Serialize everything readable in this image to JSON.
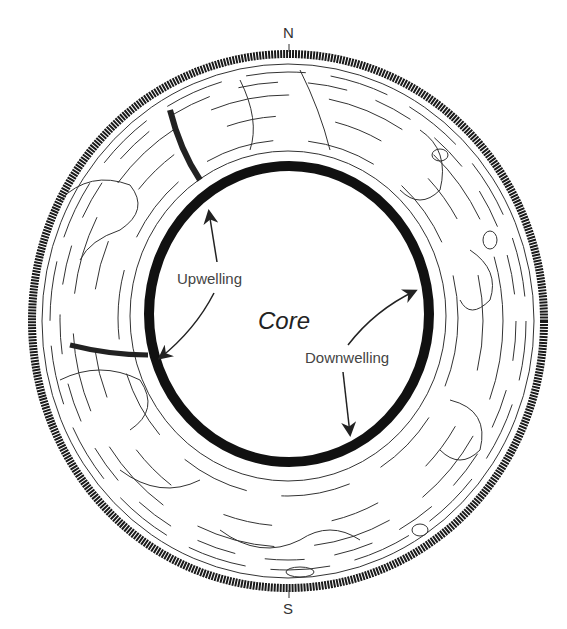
{
  "diagram": {
    "compass": {
      "north": "N",
      "south": "S"
    },
    "core_label": "Core",
    "annotations": [
      {
        "label": "Upwelling",
        "arrows": [
          "up-arrow-to-inner-boundary-north-west",
          "down-left-arrow-to-inner-boundary-west"
        ]
      },
      {
        "label": "Downwelling",
        "arrows": [
          "up-right-arrow-to-inner-boundary-east",
          "down-arrow-to-inner-boundary-south"
        ]
      }
    ],
    "colors": {
      "line": "#222222",
      "background": "#ffffff"
    }
  }
}
